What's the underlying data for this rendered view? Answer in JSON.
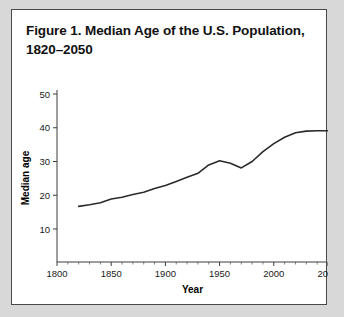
{
  "figure": {
    "title_line1": "Figure 1. Median Age of the U.S. Population,",
    "title_line2": "1820–2050",
    "panel_background": "#ffffff",
    "border_color": "#4a4a4a",
    "page_background": "#d8d8d8"
  },
  "chart_data": {
    "type": "line",
    "title": "Figure 1. Median Age of the U.S. Population, 1820–2050",
    "xlabel": "Year",
    "ylabel": "Median age",
    "xlim": [
      1800,
      2050
    ],
    "ylim": [
      0,
      50
    ],
    "grid": false,
    "legend": null,
    "line_color": "#2b2b2b",
    "x_ticks": [
      1800,
      1850,
      1900,
      1950,
      2000,
      2050
    ],
    "x_tick_labels": [
      "1800",
      "1850",
      "1900",
      "1950",
      "2000",
      "2050"
    ],
    "x_minor_tick_step": 10,
    "y_ticks": [
      10,
      20,
      30,
      40,
      50
    ],
    "y_tick_labels": [
      "10",
      "20",
      "30",
      "40",
      "50"
    ],
    "x": [
      1820,
      1830,
      1840,
      1850,
      1860,
      1870,
      1880,
      1890,
      1900,
      1910,
      1920,
      1930,
      1940,
      1950,
      1960,
      1970,
      1980,
      1990,
      2000,
      2010,
      2020,
      2030,
      2040,
      2050
    ],
    "values": [
      16.7,
      17.2,
      17.8,
      18.9,
      19.4,
      20.2,
      20.9,
      22.0,
      22.9,
      24.1,
      25.3,
      26.5,
      29.0,
      30.2,
      29.5,
      28.1,
      30.0,
      32.9,
      35.3,
      37.2,
      38.5,
      39.0,
      39.1,
      39.1
    ],
    "series": [
      {
        "name": "Median age",
        "values": [
          16.7,
          17.2,
          17.8,
          18.9,
          19.4,
          20.2,
          20.9,
          22.0,
          22.9,
          24.1,
          25.3,
          26.5,
          29.0,
          30.2,
          29.5,
          28.1,
          30.0,
          32.9,
          35.3,
          37.2,
          38.5,
          39.0,
          39.1,
          39.1
        ]
      }
    ],
    "annotations": []
  }
}
